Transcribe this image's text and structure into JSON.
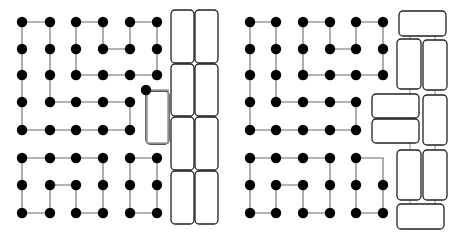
{
  "colors": {
    "dot": "#000000",
    "path": "#9a9a9a",
    "block_stroke": "#222222",
    "background": "#ffffff"
  },
  "panels": [
    {
      "id": "left",
      "paths": [
        [
          [
            22,
            22
          ],
          [
            50,
            22
          ],
          [
            50,
            102
          ],
          [
            130,
            102
          ],
          [
            130,
            130
          ],
          [
            22,
            130
          ],
          [
            22,
            22
          ]
        ],
        [
          [
            76,
            22
          ],
          [
            103,
            22
          ],
          [
            103,
            49
          ],
          [
            130,
            49
          ],
          [
            130,
            22
          ],
          [
            157,
            22
          ],
          [
            157,
            75
          ],
          [
            76,
            75
          ],
          [
            76,
            22
          ]
        ],
        [
          [
            147,
            90
          ],
          [
            168,
            90
          ],
          [
            168,
            143
          ],
          [
            147,
            143
          ],
          [
            147,
            90
          ]
        ],
        [
          [
            22,
            158
          ],
          [
            103,
            158
          ],
          [
            103,
            213
          ],
          [
            76,
            213
          ],
          [
            76,
            185
          ],
          [
            50,
            185
          ],
          [
            50,
            213
          ],
          [
            22,
            213
          ],
          [
            22,
            158
          ]
        ],
        [
          [
            130,
            158
          ],
          [
            157,
            158
          ],
          [
            157,
            213
          ],
          [
            130,
            213
          ],
          [
            130,
            158
          ]
        ]
      ],
      "dots": [
        [
          22,
          22
        ],
        [
          50,
          22
        ],
        [
          76,
          22
        ],
        [
          103,
          22
        ],
        [
          130,
          22
        ],
        [
          157,
          22
        ],
        [
          22,
          49
        ],
        [
          50,
          49
        ],
        [
          76,
          49
        ],
        [
          103,
          49
        ],
        [
          130,
          49
        ],
        [
          157,
          49
        ],
        [
          22,
          75
        ],
        [
          50,
          75
        ],
        [
          76,
          75
        ],
        [
          103,
          75
        ],
        [
          130,
          75
        ],
        [
          157,
          75
        ],
        [
          22,
          102
        ],
        [
          50,
          102
        ],
        [
          76,
          102
        ],
        [
          103,
          102
        ],
        [
          130,
          102
        ],
        [
          22,
          130
        ],
        [
          50,
          130
        ],
        [
          76,
          130
        ],
        [
          103,
          130
        ],
        [
          130,
          130
        ],
        [
          146,
          90
        ],
        [
          22,
          158
        ],
        [
          50,
          158
        ],
        [
          76,
          158
        ],
        [
          103,
          158
        ],
        [
          130,
          158
        ],
        [
          157,
          158
        ],
        [
          22,
          185
        ],
        [
          50,
          185
        ],
        [
          76,
          185
        ],
        [
          103,
          185
        ],
        [
          130,
          185
        ],
        [
          157,
          185
        ],
        [
          22,
          213
        ],
        [
          50,
          213
        ],
        [
          76,
          213
        ],
        [
          103,
          213
        ],
        [
          130,
          213
        ],
        [
          157,
          213
        ]
      ],
      "blocks": [
        {
          "x": 171,
          "y": 10,
          "w": 23,
          "h": 53
        },
        {
          "x": 195,
          "y": 10,
          "w": 23,
          "h": 53
        },
        {
          "x": 171,
          "y": 64,
          "w": 23,
          "h": 52
        },
        {
          "x": 195,
          "y": 64,
          "w": 23,
          "h": 52
        },
        {
          "x": 171,
          "y": 117,
          "w": 23,
          "h": 53
        },
        {
          "x": 195,
          "y": 117,
          "w": 23,
          "h": 53
        },
        {
          "x": 171,
          "y": 171,
          "w": 23,
          "h": 53
        },
        {
          "x": 195,
          "y": 171,
          "w": 23,
          "h": 53
        },
        {
          "x": 146,
          "y": 91,
          "w": 23,
          "h": 53
        }
      ],
      "links": []
    },
    {
      "id": "right",
      "paths": [
        [
          [
            250,
            22
          ],
          [
            276,
            22
          ],
          [
            276,
            102
          ],
          [
            356,
            102
          ],
          [
            356,
            130
          ],
          [
            250,
            130
          ],
          [
            250,
            22
          ]
        ],
        [
          [
            303,
            22
          ],
          [
            330,
            22
          ],
          [
            330,
            49
          ],
          [
            356,
            49
          ],
          [
            356,
            22
          ],
          [
            383,
            22
          ],
          [
            383,
            75
          ],
          [
            303,
            75
          ],
          [
            303,
            22
          ]
        ],
        [
          [
            250,
            158
          ],
          [
            330,
            158
          ],
          [
            330,
            213
          ],
          [
            303,
            213
          ],
          [
            303,
            185
          ],
          [
            276,
            185
          ],
          [
            276,
            213
          ],
          [
            250,
            213
          ],
          [
            250,
            158
          ]
        ],
        [
          [
            356,
            158
          ],
          [
            383,
            158
          ],
          [
            383,
            213
          ],
          [
            356,
            213
          ],
          [
            356,
            158
          ]
        ]
      ],
      "dots": [
        [
          250,
          22
        ],
        [
          276,
          22
        ],
        [
          303,
          22
        ],
        [
          330,
          22
        ],
        [
          356,
          22
        ],
        [
          383,
          22
        ],
        [
          250,
          49
        ],
        [
          276,
          49
        ],
        [
          303,
          49
        ],
        [
          330,
          49
        ],
        [
          356,
          49
        ],
        [
          383,
          49
        ],
        [
          250,
          75
        ],
        [
          276,
          75
        ],
        [
          303,
          75
        ],
        [
          330,
          75
        ],
        [
          356,
          75
        ],
        [
          383,
          75
        ],
        [
          250,
          102
        ],
        [
          276,
          102
        ],
        [
          303,
          102
        ],
        [
          330,
          102
        ],
        [
          356,
          102
        ],
        [
          250,
          130
        ],
        [
          276,
          130
        ],
        [
          303,
          130
        ],
        [
          330,
          130
        ],
        [
          356,
          130
        ],
        [
          250,
          158
        ],
        [
          276,
          158
        ],
        [
          303,
          158
        ],
        [
          330,
          158
        ],
        [
          356,
          158
        ],
        [
          250,
          185
        ],
        [
          276,
          185
        ],
        [
          303,
          185
        ],
        [
          330,
          185
        ],
        [
          356,
          185
        ],
        [
          383,
          185
        ],
        [
          250,
          213
        ],
        [
          276,
          213
        ],
        [
          303,
          213
        ],
        [
          330,
          213
        ],
        [
          356,
          213
        ],
        [
          383,
          213
        ]
      ],
      "blocks": [
        {
          "x": 399,
          "y": 11,
          "w": 47,
          "h": 25
        },
        {
          "x": 397,
          "y": 39,
          "w": 24,
          "h": 50
        },
        {
          "x": 423,
          "y": 40,
          "w": 24,
          "h": 50
        },
        {
          "x": 372,
          "y": 94,
          "w": 47,
          "h": 24
        },
        {
          "x": 423,
          "y": 95,
          "w": 24,
          "h": 50
        },
        {
          "x": 372,
          "y": 119,
          "w": 47,
          "h": 24
        },
        {
          "x": 397,
          "y": 150,
          "w": 24,
          "h": 50
        },
        {
          "x": 423,
          "y": 150,
          "w": 24,
          "h": 50
        },
        {
          "x": 397,
          "y": 204,
          "w": 47,
          "h": 25
        }
      ],
      "links": [
        [
          [
            410,
            36
          ],
          [
            410,
            39
          ]
        ],
        [
          [
            435,
            36
          ],
          [
            435,
            40
          ]
        ],
        [
          [
            410,
            89
          ],
          [
            410,
            94
          ]
        ],
        [
          [
            435,
            90
          ],
          [
            435,
            95
          ]
        ],
        [
          [
            410,
            143
          ],
          [
            410,
            150
          ]
        ],
        [
          [
            435,
            145
          ],
          [
            435,
            150
          ]
        ],
        [
          [
            410,
            200
          ],
          [
            410,
            204
          ]
        ],
        [
          [
            435,
            200
          ],
          [
            435,
            204
          ]
        ]
      ]
    }
  ]
}
